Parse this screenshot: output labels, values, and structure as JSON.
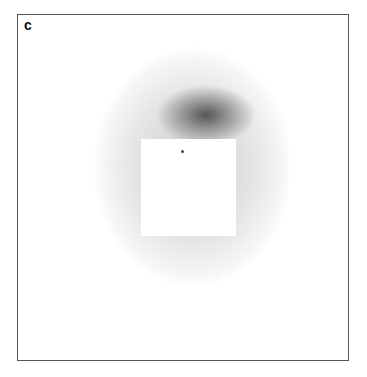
{
  "panel": {
    "label": "c",
    "description": "grayscale heatmap with central white square mask and a single dot marker",
    "colors": {
      "border": "#555555",
      "dark": "#3c3c3c",
      "light": "#e6e6e6",
      "background": "#ffffff"
    }
  }
}
